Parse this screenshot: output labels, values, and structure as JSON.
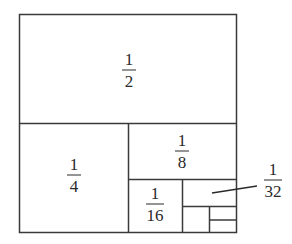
{
  "diagram": {
    "line_color": "#3a3a3a",
    "text_color": "#2a2a2a",
    "regions": [
      {
        "id": "half",
        "numerator": "1",
        "denominator": "2"
      },
      {
        "id": "quarter",
        "numerator": "1",
        "denominator": "4"
      },
      {
        "id": "eighth",
        "numerator": "1",
        "denominator": "8"
      },
      {
        "id": "sixteenth",
        "numerator": "1",
        "denominator": "16"
      },
      {
        "id": "thirtysecond",
        "numerator": "1",
        "denominator": "32"
      }
    ]
  }
}
